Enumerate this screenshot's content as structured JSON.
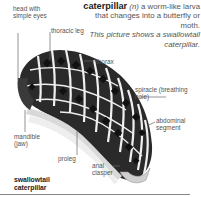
{
  "definition": {
    "term": "caterpillar",
    "part_of_speech": "(n)",
    "text": "a worm-like larva that changes into a butterfly or moth.",
    "note": "This picture shows a swallowtail caterpillar."
  },
  "labels": {
    "head": "head with simple eyes",
    "thoracic_leg": "thoracic leg",
    "thorax": "thorax",
    "spiracle": "spiracle (breathing hole)",
    "abdominal_segment": "abdominal segment",
    "mandible": "mandible (jaw)",
    "proleg": "proleg",
    "anal_clasper": "anal clasper"
  },
  "caption": {
    "line1": "swallowtail",
    "line2": "caterpillar"
  },
  "colors": {
    "body_dark": "#1e1e1e",
    "body_light": "#e8e8e8",
    "leader_line": "#666666"
  }
}
